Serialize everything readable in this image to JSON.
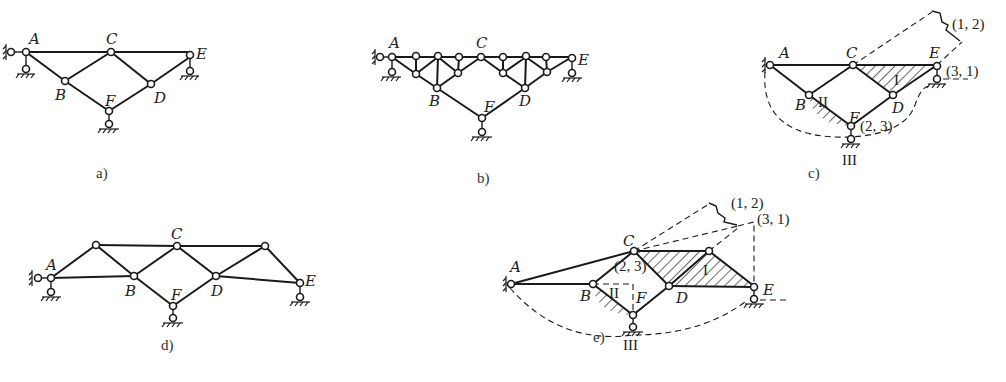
{
  "figure": {
    "panels": [
      {
        "id": "a",
        "caption": "a)",
        "nodes": {
          "A": "A",
          "B": "B",
          "C": "C",
          "D": "D",
          "E": "E",
          "F": "F"
        }
      },
      {
        "id": "b",
        "caption": "b)",
        "nodes": {
          "A": "A",
          "B": "B",
          "C": "C",
          "D": "D",
          "E": "E",
          "F": "F"
        }
      },
      {
        "id": "c",
        "caption": "c)",
        "nodes": {
          "A": "A",
          "B": "B",
          "C": "C",
          "D": "D",
          "E": "E",
          "F": "F"
        },
        "rigid_bodies": [
          "I",
          "II",
          "III"
        ],
        "instant_centers": [
          "(1, 2)",
          "(3, 1)",
          "(2, 3)"
        ]
      },
      {
        "id": "d",
        "caption": "d)",
        "nodes": {
          "A": "A",
          "B": "B",
          "C": "C",
          "D": "D",
          "E": "E",
          "F": "F"
        }
      },
      {
        "id": "e",
        "caption": "e)",
        "nodes": {
          "A": "A",
          "B": "B",
          "C": "C",
          "D": "D",
          "E": "E",
          "F": "F"
        },
        "rigid_bodies": [
          "I",
          "II",
          "III"
        ],
        "instant_centers": [
          "(1, 2)",
          "(3, 1)",
          "(2, 3)"
        ]
      }
    ]
  }
}
